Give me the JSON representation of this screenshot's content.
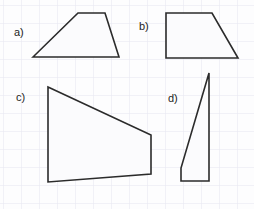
{
  "worksheet": {
    "title": "Quadrilateral figures worksheet",
    "width": 254,
    "height": 209,
    "background_color": "#fdfdfe"
  },
  "grid": {
    "visible": true,
    "cell_size": 18,
    "origin_x": 3,
    "origin_y": 5,
    "line_color": "#e6e6ef",
    "line_width": 1
  },
  "style": {
    "stroke_color": "#2b2b2b",
    "stroke_width": 1.6,
    "fill_color": "#fbfbfd",
    "label_color": "#1d1d1d",
    "label_font_size": 11
  },
  "figures": [
    {
      "id": "a",
      "label": "a)",
      "shape_name": "trapezoid-a",
      "label_x": 14,
      "label_y": 26,
      "points": "33,57 78,13 105,13 119,57",
      "vertices": [
        {
          "x": 33,
          "y": 57
        },
        {
          "x": 78,
          "y": 13
        },
        {
          "x": 105,
          "y": 13
        },
        {
          "x": 119,
          "y": 57
        }
      ]
    },
    {
      "id": "b",
      "label": "b)",
      "shape_name": "trapezoid-b",
      "label_x": 139,
      "label_y": 20,
      "points": "166,13 212,13 238,58 166,58",
      "vertices": [
        {
          "x": 166,
          "y": 13
        },
        {
          "x": 212,
          "y": 13
        },
        {
          "x": 238,
          "y": 58
        },
        {
          "x": 166,
          "y": 58
        }
      ]
    },
    {
      "id": "c",
      "label": "c)",
      "shape_name": "trapezoid-c",
      "label_x": 16,
      "label_y": 91,
      "points": "48,87 151,135 151,174 48,182",
      "vertices": [
        {
          "x": 48,
          "y": 87
        },
        {
          "x": 151,
          "y": 135
        },
        {
          "x": 151,
          "y": 174
        },
        {
          "x": 48,
          "y": 182
        }
      ]
    },
    {
      "id": "d",
      "label": "d)",
      "shape_name": "trapezoid-d",
      "label_x": 168,
      "label_y": 92,
      "points": "209,73 209,181 181,181 181,168",
      "vertices": [
        {
          "x": 209,
          "y": 73
        },
        {
          "x": 209,
          "y": 181
        },
        {
          "x": 181,
          "y": 181
        },
        {
          "x": 181,
          "y": 168
        }
      ]
    }
  ]
}
